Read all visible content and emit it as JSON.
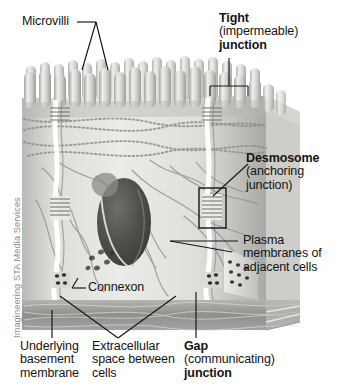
{
  "figure": {
    "credit": "Imagineering STA Media Services",
    "background": "#ffffff",
    "ink": "#141414"
  },
  "labels": {
    "microvilli": "Microvilli",
    "tight_line1": "Tight",
    "tight_line2": "(impermeable)",
    "tight_line3": "junction",
    "desmosome_line1": "Desmosome",
    "desmosome_line2": "(anchoring",
    "desmosome_line3": "junction)",
    "plasma_line1": "Plasma",
    "plasma_line2": "membranes of",
    "plasma_line3": "adjacent cells",
    "connexon": "Connexon",
    "basement_line1": "Underlying",
    "basement_line2": "basement",
    "basement_line3": "membrane",
    "extracellular_line1": "Extracellular",
    "extracellular_line2": "space between",
    "extracellular_line3": "cells",
    "gap_line1": "Gap",
    "gap_line2": "(communicating)",
    "gap_line3": "junction"
  },
  "colors": {
    "tissue_light": "#e8e8e6",
    "tissue_mid": "#c9c9c5",
    "tissue_dark": "#9a9a96",
    "nucleus": "#4a4a48",
    "membrane_slab": "#8d8d89",
    "leader": "#141414"
  }
}
